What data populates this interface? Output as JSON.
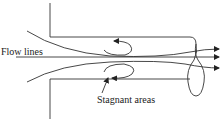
{
  "diagram": {
    "type": "fluid-flow-pipe-entrance",
    "labels": {
      "flow_lines": "Flow lines",
      "stagnant_areas": "Stagnant areas"
    },
    "colors": {
      "stroke": "#333333",
      "background": "#ffffff"
    },
    "elements": [
      {
        "id": "upper-wall",
        "kind": "wall"
      },
      {
        "id": "lower-wall",
        "kind": "wall"
      },
      {
        "id": "pipe-outlet",
        "kind": "ellipse"
      },
      {
        "id": "flow-line-upper",
        "kind": "streamline",
        "arrow": true
      },
      {
        "id": "flow-line-center",
        "kind": "streamline",
        "arrow": true
      },
      {
        "id": "flow-line-lower",
        "kind": "streamline",
        "arrow": true
      },
      {
        "id": "eddy-upper",
        "kind": "recirculation",
        "arrow": true
      },
      {
        "id": "eddy-lower",
        "kind": "recirculation",
        "arrow": true
      }
    ]
  }
}
